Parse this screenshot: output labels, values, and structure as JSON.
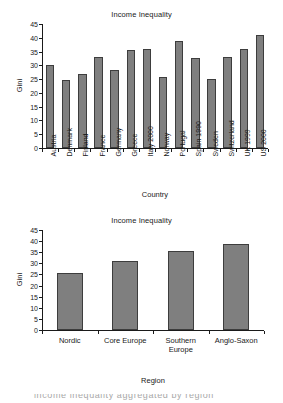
{
  "chart_data": [
    {
      "type": "bar",
      "title": "Income Inequality",
      "xlabel": "Country",
      "ylabel": "Gini",
      "ylim": [
        0,
        45
      ],
      "yticks": [
        0,
        5,
        10,
        15,
        20,
        25,
        30,
        35,
        40,
        45
      ],
      "grid": false,
      "legend": "none",
      "bar_color": "#7f7f7f",
      "bar_edge_color": "#3d3d3d",
      "categories": [
        "Austria",
        "Denmark",
        "Finland",
        "France",
        "Germany",
        "Greece",
        "Italy 2000",
        "Norway",
        "Portugal",
        "Spain 1990",
        "Sweden",
        "Switzerland",
        "UK 1999",
        "US 2000"
      ],
      "values": [
        30.0,
        24.7,
        26.9,
        32.9,
        28.3,
        35.5,
        36.0,
        25.9,
        38.7,
        32.7,
        25.0,
        33.1,
        36.0,
        40.9
      ]
    },
    {
      "type": "bar",
      "title": "Income Inequality",
      "xlabel": "Region",
      "ylabel": "Gini",
      "ylim": [
        0,
        45
      ],
      "yticks": [
        0,
        5,
        10,
        15,
        20,
        25,
        30,
        35,
        40,
        45
      ],
      "grid": false,
      "legend": "none",
      "bar_color": "#7f7f7f",
      "bar_edge_color": "#3d3d3d",
      "categories": [
        "Nordic",
        "Core Europe",
        "Southern Europe",
        "Anglo-Saxon"
      ],
      "category_lines": [
        [
          "Nordic"
        ],
        [
          "Core Europe"
        ],
        [
          "Southern",
          "Europe"
        ],
        [
          "Anglo-Saxon"
        ]
      ],
      "values": [
        25.7,
        31.1,
        35.7,
        38.5
      ]
    }
  ],
  "page": {
    "bottom_cropped_text": "income inequality aggregated by region"
  }
}
